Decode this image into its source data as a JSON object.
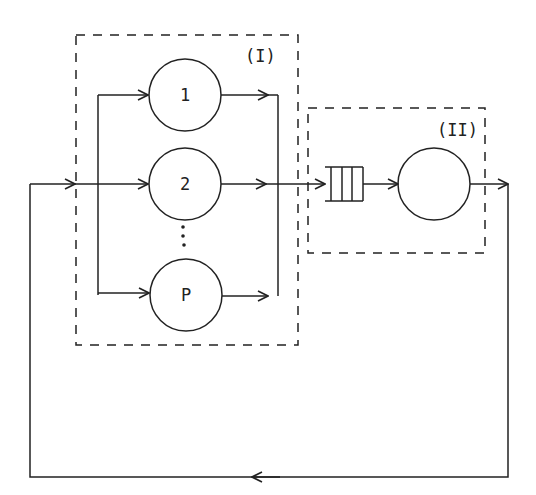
{
  "diagram": {
    "type": "queueing-network",
    "groups": [
      {
        "id": "I",
        "label": "(I)"
      },
      {
        "id": "II",
        "label": "(II)"
      }
    ],
    "servers": [
      {
        "id": "s1",
        "label": "1",
        "group": "I"
      },
      {
        "id": "s2",
        "label": "2",
        "group": "I"
      },
      {
        "id": "sP",
        "label": "P",
        "group": "I"
      },
      {
        "id": "s_ii",
        "label": "",
        "group": "II"
      }
    ],
    "ellipsis": "⋮",
    "queue": {
      "slots": 3,
      "group": "II"
    },
    "edges": [
      "feedback-loop -> fork",
      "fork -> 1",
      "fork -> 2",
      "fork -> P",
      "1 -> join",
      "2 -> join",
      "P -> join",
      "join -> queue",
      "queue -> server II",
      "server II -> feedback-loop"
    ],
    "colors": {
      "stroke": "#222222",
      "background": "#ffffff"
    }
  }
}
